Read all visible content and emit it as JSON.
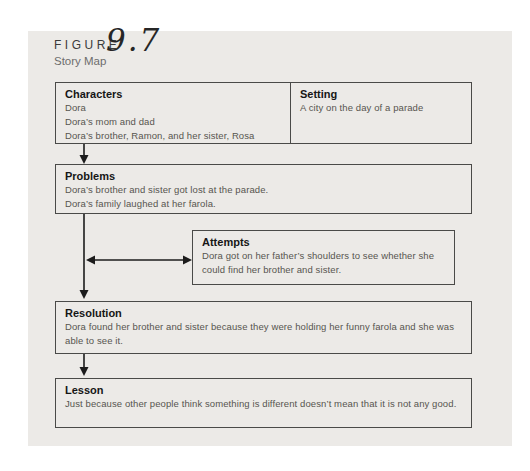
{
  "figure": {
    "label": "FIGURE",
    "number": "9.7",
    "subtitle": "Story Map"
  },
  "story_map": {
    "characters": {
      "title": "Characters",
      "lines": [
        "Dora",
        "Dora’s mom and dad",
        "Dora’s brother, Ramon, and her sister, Rosa"
      ]
    },
    "setting": {
      "title": "Setting",
      "lines": [
        "A city on the day of a parade"
      ]
    },
    "problems": {
      "title": "Problems",
      "lines": [
        "Dora’s brother and sister got lost at the parade.",
        "Dora’s family laughed at her farola."
      ]
    },
    "attempts": {
      "title": "Attempts",
      "text": "Dora got on her father’s shoulders to see whether she could find her brother and sister."
    },
    "resolution": {
      "title": "Resolution",
      "text": "Dora found her brother and sister because they were holding her funny farola and she was able to see it."
    },
    "lesson": {
      "title": "Lesson",
      "text": "Just because other people think something is different doesn’t mean that it is not any good."
    }
  },
  "colors": {
    "panel_background": "#eceae7",
    "box_border": "#4a4a48",
    "heading_text": "#161616",
    "body_text": "#57554f",
    "figure_label": "#3b3b3b",
    "subtitle_text": "#6d6d6d",
    "arrow": "#1c1c1c"
  }
}
